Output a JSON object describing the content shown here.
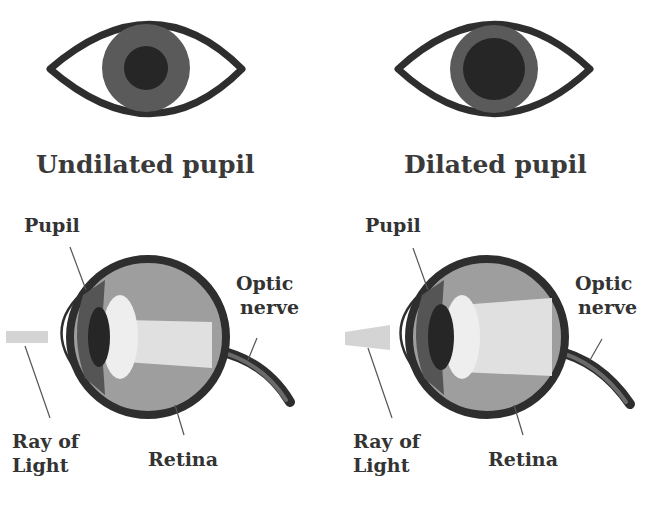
{
  "colors": {
    "outline": "#2e2e2e",
    "iris": "#5a5a5a",
    "pupil": "#262626",
    "vitreous": "#9e9e9e",
    "iris_side": "#555555",
    "lens": "#e6e6e6",
    "light_ray": "#d4d4d4",
    "background": "#ffffff"
  },
  "panels": [
    {
      "title": "Undilated pupil",
      "labels": {
        "pupil": "Pupil",
        "optic_nerve_line1": "Optic",
        "optic_nerve_line2": "nerve",
        "ray_line1": "Ray of",
        "ray_line2": "Light",
        "retina": "Retina"
      }
    },
    {
      "title": "Dilated pupil",
      "labels": {
        "pupil": "Pupil",
        "optic_nerve_line1": "Optic",
        "optic_nerve_line2": "nerve",
        "ray_line1": "Ray of",
        "ray_line2": "Light",
        "retina": "Retina"
      }
    }
  ]
}
